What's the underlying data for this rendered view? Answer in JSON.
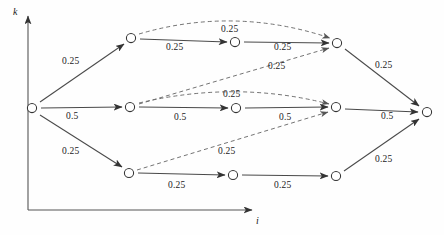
{
  "figure": {
    "type": "trellis-diagram",
    "axes": {
      "y_label": "k",
      "x_label": "i"
    },
    "node_count": 11,
    "nodes": [
      {
        "id": "S",
        "x": 32,
        "y": 108,
        "name": "node-source"
      },
      {
        "id": "T1",
        "x": 131,
        "y": 38,
        "name": "node-top-1"
      },
      {
        "id": "T2",
        "x": 235,
        "y": 42,
        "name": "node-top-2"
      },
      {
        "id": "T3",
        "x": 337,
        "y": 43,
        "name": "node-top-3"
      },
      {
        "id": "M1",
        "x": 130,
        "y": 107,
        "name": "node-mid-1"
      },
      {
        "id": "M2",
        "x": 236,
        "y": 108,
        "name": "node-mid-2"
      },
      {
        "id": "M3",
        "x": 336,
        "y": 107,
        "name": "node-mid-3"
      },
      {
        "id": "B1",
        "x": 129,
        "y": 173,
        "name": "node-bot-1"
      },
      {
        "id": "B2",
        "x": 233,
        "y": 175,
        "name": "node-bot-2"
      },
      {
        "id": "B3",
        "x": 336,
        "y": 176,
        "name": "node-bot-3"
      },
      {
        "id": "E",
        "x": 427,
        "y": 112,
        "name": "node-sink"
      }
    ],
    "edges": [
      {
        "id": "e1",
        "from": "S",
        "to": "T1",
        "style": "solid",
        "label": "0.25",
        "lx": 68,
        "ly": 62
      },
      {
        "id": "e2",
        "from": "S",
        "to": "M1",
        "style": "solid",
        "label": "0.5",
        "lx": 72,
        "ly": 117
      },
      {
        "id": "e3",
        "from": "S",
        "to": "B1",
        "style": "solid",
        "label": "0.25",
        "lx": 68,
        "ly": 152
      },
      {
        "id": "e4",
        "from": "T1",
        "to": "T2",
        "style": "solid",
        "label": "0.25",
        "lx": 172,
        "ly": 47
      },
      {
        "id": "e5",
        "from": "T2",
        "to": "T3",
        "style": "solid",
        "label": "0.25",
        "lx": 281,
        "ly": 47
      },
      {
        "id": "e6",
        "from": "M1",
        "to": "M2",
        "style": "solid",
        "label": "0.5",
        "lx": 178,
        "ly": 118
      },
      {
        "id": "e7",
        "from": "M2",
        "to": "M3",
        "style": "solid",
        "label": "0.5",
        "lx": 283,
        "ly": 118
      },
      {
        "id": "e8",
        "from": "B1",
        "to": "B2",
        "style": "solid",
        "label": "0.25",
        "lx": 174,
        "ly": 185
      },
      {
        "id": "e9",
        "from": "B2",
        "to": "B3",
        "style": "solid",
        "label": "0.25",
        "lx": 281,
        "ly": 185
      },
      {
        "id": "e10",
        "from": "T3",
        "to": "E",
        "style": "solid",
        "label": "0.25",
        "lx": 382,
        "ly": 66
      },
      {
        "id": "e11",
        "from": "M3",
        "to": "E",
        "style": "solid",
        "label": "0.5",
        "lx": 385,
        "ly": 117
      },
      {
        "id": "e12",
        "from": "B3",
        "to": "E",
        "style": "solid",
        "label": "0.25",
        "lx": 382,
        "ly": 160
      },
      {
        "id": "e13",
        "from": "T1",
        "to": "T3",
        "style": "dashed",
        "label": "0.25",
        "lx": 234,
        "ly": 30
      },
      {
        "id": "e14",
        "from": "M1",
        "to": "T3",
        "style": "dashed",
        "label": "0.25",
        "lx": 281,
        "ly": 67
      },
      {
        "id": "e15",
        "from": "M1",
        "to": "M3",
        "style": "dashed",
        "label": "0.25",
        "lx": 236,
        "ly": 95
      },
      {
        "id": "e16",
        "from": "B1",
        "to": "M3",
        "style": "dashed",
        "label": "0.25",
        "lx": 231,
        "ly": 152
      }
    ],
    "labels": {
      "p025": "0.25",
      "p05": "0.5"
    }
  }
}
